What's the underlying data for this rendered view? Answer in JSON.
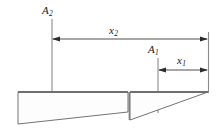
{
  "figure": {
    "type": "engineering-dimension-diagram",
    "background_color": "#ffffff",
    "line_color": "#3a3a3a",
    "outline_color": "#555555",
    "fill_color": "#fdfdfd",
    "labels": [
      {
        "id": "A2",
        "base": "A",
        "sub": "2",
        "text": "A2",
        "meaning": "area-2-centroid-marker"
      },
      {
        "id": "x2",
        "base": "x",
        "sub": "2",
        "text": "x2",
        "meaning": "distance-2-dimension"
      },
      {
        "id": "A1",
        "base": "A",
        "sub": "1",
        "text": "A1",
        "meaning": "area-1-centroid-marker"
      },
      {
        "id": "x1",
        "base": "x",
        "sub": "1",
        "text": "x1",
        "meaning": "distance-1-dimension"
      }
    ],
    "dimensions": [
      {
        "name": "x2",
        "from_x": 52,
        "to_x": 208,
        "y": 39,
        "arrow_both_ends": true
      },
      {
        "name": "x1",
        "from_x": 158,
        "to_x": 208,
        "y": 70,
        "arrow_both_ends": true
      }
    ],
    "centroid_lines": [
      {
        "name": "A2",
        "x": 52,
        "y_top": 19,
        "y_bottom": 113
      },
      {
        "name": "A1",
        "x": 158,
        "y_top": 58,
        "y_bottom": 113
      }
    ],
    "reference_line": {
      "x": 208,
      "y_top": 32,
      "y_bottom": 93
    },
    "shapes": [
      {
        "name": "left-wedge-area-2",
        "kind": "trapezoid",
        "points": "18,92 128,92 128,112 18,124"
      },
      {
        "name": "right-wedge-area-1",
        "kind": "triangle",
        "points": "130,92 208,92 130,120"
      }
    ]
  }
}
